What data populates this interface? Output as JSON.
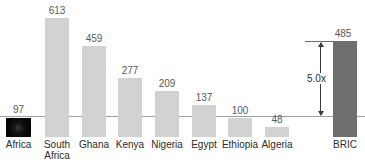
{
  "chart_data": {
    "type": "bar",
    "title": "",
    "xlabel": "",
    "ylabel": "",
    "grid": false,
    "legend": "none",
    "categories": [
      "Africa",
      "South\nAfrica",
      "Ghana",
      "Kenya",
      "Nigeria",
      "Egypt",
      "Ethiopia",
      "Algeria",
      "BRIC"
    ],
    "values": [
      97,
      613,
      459,
      277,
      209,
      137,
      100,
      48,
      485
    ],
    "value_labels": [
      "97",
      "613",
      "459",
      "277",
      "209",
      "137",
      "100",
      "48",
      "485"
    ],
    "ylim": [
      0,
      640
    ],
    "baseline_value": 100,
    "annotations": [
      {
        "text": "5.0x",
        "from_value": 100,
        "to_value": 485,
        "target": "BRIC"
      }
    ],
    "series_styles": [
      {
        "category": "Africa",
        "fill": "#0a0a0a",
        "style": "photo"
      },
      {
        "category": "South Africa",
        "fill": "#d2d2d2",
        "style": "solid"
      },
      {
        "category": "Ghana",
        "fill": "#d2d2d2",
        "style": "solid"
      },
      {
        "category": "Kenya",
        "fill": "#d2d2d2",
        "style": "solid"
      },
      {
        "category": "Nigeria",
        "fill": "#d2d2d2",
        "style": "solid"
      },
      {
        "category": "Egypt",
        "fill": "#d2d2d2",
        "style": "solid"
      },
      {
        "category": "Ethiopia",
        "fill": "#d2d2d2",
        "style": "solid"
      },
      {
        "category": "Algeria",
        "fill": "#d2d2d2",
        "style": "solid"
      },
      {
        "category": "BRIC",
        "fill": "#6e6e6e",
        "style": "solid"
      }
    ]
  },
  "colors": {
    "bar_light": "#d2d2d2",
    "bar_dark": "#6e6e6e",
    "bar_photo": "#0a0a0a",
    "axis_line": "#9aa0a6",
    "value_text": "#555a5e",
    "category_text": "#2b2b2b",
    "annotation": "#3c3c3c",
    "background": "#ffffff"
  },
  "layout": {
    "bars": [
      {
        "key": "africa",
        "x": 6,
        "w": 25,
        "top": 118,
        "bottom": 137,
        "label_x": 6,
        "label_y": 104,
        "cat_x": 0,
        "cat_y": 139
      },
      {
        "key": "south-africa",
        "x": 45,
        "w": 24,
        "top": 18,
        "bottom": 137,
        "label_x": 45,
        "label_y": 5,
        "cat_x": 39,
        "cat_y": 139
      },
      {
        "key": "ghana",
        "x": 82,
        "w": 24,
        "top": 46,
        "bottom": 137,
        "label_x": 82,
        "label_y": 33,
        "cat_x": 76,
        "cat_y": 139
      },
      {
        "key": "kenya",
        "x": 118,
        "w": 24,
        "top": 78,
        "bottom": 137,
        "label_x": 118,
        "label_y": 65,
        "cat_x": 112,
        "cat_y": 139
      },
      {
        "key": "nigeria",
        "x": 155,
        "w": 24,
        "top": 91,
        "bottom": 137,
        "label_x": 155,
        "label_y": 78,
        "cat_x": 147,
        "cat_y": 139
      },
      {
        "key": "egypt",
        "x": 192,
        "w": 24,
        "top": 105,
        "bottom": 137,
        "label_x": 192,
        "label_y": 92,
        "cat_x": 186,
        "cat_y": 139
      },
      {
        "key": "ethiopia",
        "x": 228,
        "w": 24,
        "top": 118,
        "bottom": 137,
        "label_x": 228,
        "label_y": 105,
        "cat_x": 219,
        "cat_y": 139
      },
      {
        "key": "algeria",
        "x": 265,
        "w": 24,
        "top": 127,
        "bottom": 137,
        "label_x": 265,
        "label_y": 114,
        "cat_x": 258,
        "cat_y": 139
      },
      {
        "key": "bric",
        "x": 333,
        "w": 24,
        "top": 41,
        "bottom": 137,
        "label_x": 331,
        "label_y": 28,
        "cat_x": 327,
        "cat_y": 139
      }
    ],
    "axis_y": 116,
    "annotation": {
      "rule_x": 305,
      "rule_w": 30,
      "rule_y": 41,
      "arrow_x": 320,
      "arrow_top": 43,
      "arrow_bottom": 115,
      "label_x": 305,
      "label_y": 73
    }
  }
}
